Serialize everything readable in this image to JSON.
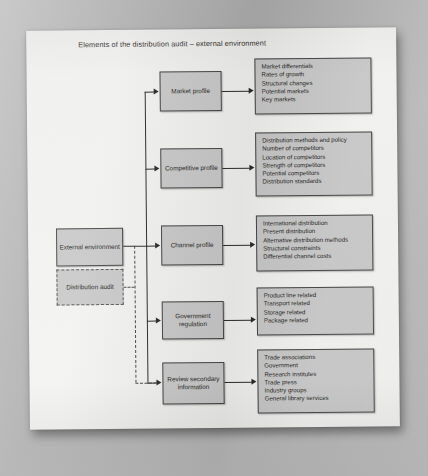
{
  "title": "Elements of the distribution audit – external environment",
  "source_nodes": {
    "external_environment": "External environment",
    "distribution_audit": "Distribution audit"
  },
  "branches": [
    {
      "node": "Market profile",
      "items": [
        "Market differentials",
        "Rates of growth",
        "Structural changes",
        "Potential markets",
        "Key markets"
      ]
    },
    {
      "node": "Competitive profile",
      "items": [
        "Distribution methods and policy",
        "Number of competitors",
        "Location of competitors",
        "Strength of competitors",
        "Potential competitors",
        "Distribution standards"
      ]
    },
    {
      "node": "Channel profile",
      "items": [
        "International distribution",
        "Present distribution",
        "Alternative distribution methods",
        "Structural constraints",
        "Differential channel costs"
      ]
    },
    {
      "node": "Government regulation",
      "items": [
        "Product line related",
        "Transport related",
        "Storage related",
        "Package related"
      ]
    },
    {
      "node": "Review secondary information",
      "items": [
        "Trade associations",
        "Government",
        "Research institutes",
        "Trade press",
        "Industry groups",
        "General library services"
      ]
    }
  ],
  "colors": {
    "box_fill": "#d2d2d2",
    "box_border": "#4a4a4a",
    "line": "#2e2c2a",
    "page": "#fdfdfb",
    "backdrop": "#b9b9b9"
  }
}
